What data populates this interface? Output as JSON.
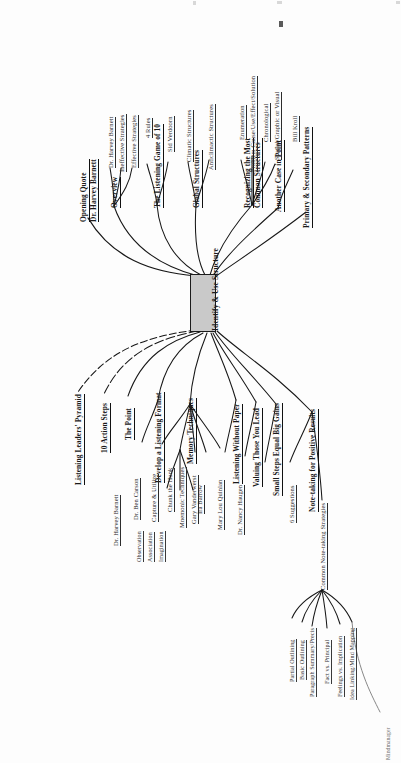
{
  "document": {
    "type": "mind-map",
    "title": "Identify & Use Structure",
    "orientation": "rotated-90",
    "brand": "Mindmanager"
  },
  "root": {
    "label_line1": "Identify &",
    "label_line2": "Use Structure",
    "fill_color": "#c9c9c9",
    "border_color": "#1b1b1b"
  },
  "branches": [
    {
      "id": "opening-quote",
      "label_line1": "Opening Quote",
      "label_line2": "Dr. Harvey Barnett",
      "children": []
    },
    {
      "id": "overview",
      "label": "Overview",
      "children": [
        {
          "label": "Dr. Harvey Barnett"
        },
        {
          "label": "Ineffective Strategies"
        },
        {
          "label": "Effective Strategies"
        }
      ]
    },
    {
      "id": "listening-game",
      "label": "The Listening Game of 10",
      "children": [
        {
          "label": "4 Rules"
        },
        {
          "label": "Sid Verdoorn"
        }
      ]
    },
    {
      "id": "global-structures",
      "label": "Global Structures",
      "children": [
        {
          "label": "Climatic Structures"
        },
        {
          "label": "Anticlimactic Structures"
        }
      ]
    },
    {
      "id": "recognizing-common-structures",
      "label_line1": "Recognizing the Most",
      "label_line2": "Common Structures",
      "children": [
        {
          "label": "Enumeration"
        },
        {
          "label": "Problem Cause/Use/Effect/Solution"
        },
        {
          "label": "Chronological"
        },
        {
          "label": "Spatial/Graphic or Visual"
        }
      ]
    },
    {
      "id": "another-case-in-point",
      "label": "Another Case in Point",
      "children": [
        {
          "label": "Bill Kroll"
        }
      ]
    },
    {
      "id": "primary-secondary-patterns",
      "label": "Primary & Secondary Patterns",
      "children": []
    },
    {
      "id": "listening-leaders-pyramid",
      "label": "Listening Leaders' Pyramid",
      "children": []
    },
    {
      "id": "ten-action-steps",
      "label": "10 Action Steps",
      "children": []
    },
    {
      "id": "the-point",
      "label": "The Point",
      "children": []
    },
    {
      "id": "develop-listening-format",
      "label": "Develop a Listening Format",
      "children": [
        {
          "label": "Dr. Harvey Barnett"
        }
      ]
    },
    {
      "id": "memory-techniques",
      "label": "Memory Techniques",
      "children": [
        {
          "label": "Dr. Ben Carson"
        },
        {
          "label": "Capture & Utilize",
          "children": [
            {
              "label": "Observation"
            },
            {
              "label": "Association"
            },
            {
              "label": "Imagination"
            }
          ]
        },
        {
          "label": "Chunk the Hunk"
        },
        {
          "label": "Mnemonic Techniques"
        },
        {
          "label": "Gary Vanderwerst"
        }
      ]
    },
    {
      "id": "listening-without-paper",
      "label": "Listening Without Paper",
      "children": [
        {
          "label": "Ira Barrow"
        }
      ]
    },
    {
      "id": "valuing-those-you-lead",
      "label": "Valuing Those You Lead",
      "children": [
        {
          "label": "Mary Lou Quinlan"
        }
      ]
    },
    {
      "id": "small-steps-big-gains",
      "label": "Small Steps Equal Big Gains",
      "children": [
        {
          "label": "Dr. Nancy Haugen"
        }
      ]
    },
    {
      "id": "note-taking-positive-results",
      "label": "Note-taking for Positive Results",
      "children": [
        {
          "label": "6 Suggestions"
        },
        {
          "label": "Common Note-taking Strategies",
          "children": [
            {
              "label": "Partial Outlining"
            },
            {
              "label": "Basic Outlining"
            },
            {
              "label": "Paragraph Summary/Precis"
            },
            {
              "label": "Fact vs. Principal"
            },
            {
              "label": "Feelings vs. Implication"
            },
            {
              "label": "Idea Linking/Mind Mapping"
            }
          ]
        }
      ]
    }
  ],
  "footer": {
    "brand_label": "Mindmanager"
  }
}
